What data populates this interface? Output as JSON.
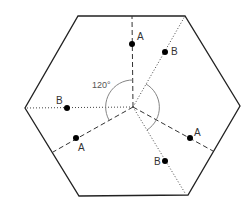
{
  "diagram": {
    "colors": {
      "hexagon": "#222222",
      "line": "#333333",
      "arc": "#777777",
      "dot": "#000000"
    },
    "angle_label": "120°",
    "hexagon": {
      "vertices": [
        [
          78,
          16
        ],
        [
          185,
          16
        ],
        [
          240,
          106
        ],
        [
          188,
          195
        ],
        [
          79,
          196
        ],
        [
          25,
          108
        ]
      ]
    },
    "center": [
      133,
      107
    ],
    "rays": [
      {
        "site": "A",
        "style": "dashed",
        "end": [
          132,
          16
        ]
      },
      {
        "site": "B",
        "style": "dotted",
        "end": [
          185,
          16
        ]
      },
      {
        "site": "B",
        "style": "dotted",
        "end": [
          25,
          108
        ]
      },
      {
        "site": "A",
        "style": "dashed",
        "end": [
          53,
          152
        ]
      },
      {
        "site": "A",
        "style": "dashed",
        "end": [
          213,
          151
        ]
      },
      {
        "site": "B",
        "style": "dotted",
        "end": [
          185,
          193
        ]
      }
    ],
    "points": [
      {
        "label": "A",
        "x": 132,
        "y": 44,
        "lx": 137,
        "ly": 40
      },
      {
        "label": "B",
        "x": 165,
        "y": 52,
        "lx": 171,
        "ly": 54
      },
      {
        "label": "B",
        "x": 67,
        "y": 108,
        "lx": 57,
        "ly": 104
      },
      {
        "label": "A",
        "x": 76,
        "y": 138,
        "lx": 78,
        "ly": 151
      },
      {
        "label": "A",
        "x": 190,
        "y": 138,
        "lx": 194,
        "ly": 136
      },
      {
        "label": "B",
        "x": 165,
        "y": 161,
        "lx": 154,
        "ly": 165
      }
    ]
  }
}
